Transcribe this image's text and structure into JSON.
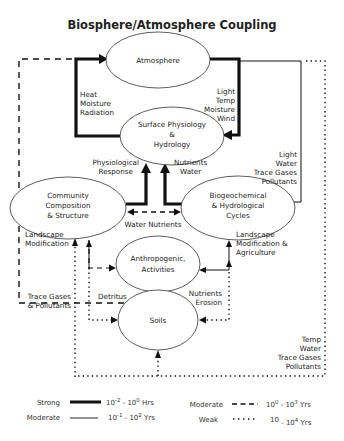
{
  "title": "Biosphere/Atmosphere Coupling",
  "nodes": {
    "atmosphere": {
      "label": [
        "Atmosphere"
      ]
    },
    "surface": {
      "label": [
        "Surface Physiology",
        "&",
        "Hydrology"
      ]
    },
    "community": {
      "label": [
        "Community",
        "Composition",
        "& Structure"
      ]
    },
    "biogeo": {
      "label": [
        "Biogeochemical",
        "& Hydrological",
        "Cycles"
      ]
    },
    "anthro": {
      "label": [
        "Anthropogenic,",
        "Activities"
      ]
    },
    "soils": {
      "label": [
        "Soils"
      ]
    }
  },
  "edge_labels": {
    "heat": [
      "Heat",
      "Moisture",
      "Radiation"
    ],
    "light_temp": [
      "Light",
      "Temp",
      "Moisture",
      "Wind"
    ],
    "physio": [
      "Physiological",
      "Response"
    ],
    "nutrients_water": [
      "Nutrients",
      "Water"
    ],
    "light_water": [
      "Light",
      "Water",
      "Trace Gases",
      "Pollutants"
    ],
    "water_nutrients": [
      "Water Nutrients"
    ],
    "landscape_mod": [
      "Landscape",
      "Modification"
    ],
    "landscape_agri": [
      "Landscape",
      "Modification &",
      "Agriculture"
    ],
    "trace_gases": [
      "Trace Gases",
      "& Pollutants"
    ],
    "detritus": [
      "Detritus"
    ],
    "nutrients_erosion": [
      "Nutrients",
      "Erosion"
    ],
    "temp_water": [
      "Temp",
      "Water",
      "Trace Gases",
      "Pollutants"
    ]
  },
  "legend": [
    {
      "name": "Strong",
      "style": "strong",
      "range_base1": "10",
      "exp1": "-2",
      "range_base2": "10",
      "exp2": "0",
      "unit": "Hrs"
    },
    {
      "name": "Moderate",
      "style": "thin",
      "range_base1": "10",
      "exp1": "-1",
      "range_base2": "10",
      "exp2": "2",
      "unit": "Yrs"
    },
    {
      "name": "Moderate",
      "style": "dashed",
      "range_base1": "10",
      "exp1": "0",
      "range_base2": "10",
      "exp2": "3",
      "unit": "Yrs"
    },
    {
      "name": "Weak",
      "style": "dotted",
      "range_base1": "10",
      "exp1": "",
      "range_base2": "10",
      "exp2": "4",
      "unit": "Yrs"
    }
  ],
  "colors": {
    "line": "#111111",
    "text": "#222222",
    "background": "#ffffff"
  }
}
